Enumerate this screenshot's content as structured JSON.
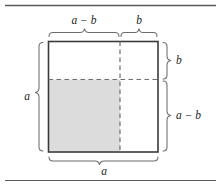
{
  "figure": {
    "name": "algebraic-square-difference-diagram",
    "colors": {
      "shaded_region": "#dcdcdc",
      "square_border": "#3a3a3a",
      "dashed_line": "#6d6d6d",
      "brace": "#6d6d6d",
      "rule": "#5a5a5a",
      "text": "#231f20",
      "background": "#ffffff"
    },
    "rules": {
      "top_rule_y": 5,
      "bottom_rule_y": 180
    },
    "square": {
      "x": 48,
      "y": 41,
      "width": 110,
      "height": 111,
      "split_x": 120,
      "split_y": 79
    },
    "labels": {
      "top_left": "a − b",
      "top_right": "b",
      "right_top": "b",
      "right_bottom": "a − b",
      "left": "a",
      "bottom": "a"
    },
    "braces": [
      {
        "id": "brace-top-left",
        "orientation": "top",
        "label": "a − b",
        "spans": "left segment of top edge"
      },
      {
        "id": "brace-top-right",
        "orientation": "top",
        "label": "b",
        "spans": "right segment of top edge"
      },
      {
        "id": "brace-right-top",
        "orientation": "right",
        "label": "b",
        "spans": "upper segment of right edge"
      },
      {
        "id": "brace-right-bottom",
        "orientation": "right",
        "label": "a − b",
        "spans": "lower segment of right edge"
      },
      {
        "id": "brace-left",
        "orientation": "left",
        "label": "a",
        "spans": "full left edge"
      },
      {
        "id": "brace-bottom",
        "orientation": "bottom",
        "label": "a",
        "spans": "full bottom edge"
      }
    ]
  }
}
